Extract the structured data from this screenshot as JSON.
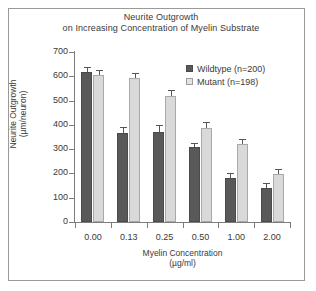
{
  "figure": {
    "frame_color": "#9a9a9a",
    "background": "#ffffff"
  },
  "chart_data": {
    "type": "bar",
    "title": "Neurite Outgrowth on Increasing Concentration of Myelin Substrate",
    "title_lines": [
      "Neurite Outgrowth",
      "on Increasing Concentration of Myelin Substrate"
    ],
    "xlabel": "Myelin Concentration (µg/ml)",
    "xlabel_lines": [
      "Myelin Concentration",
      "(µg/ml)"
    ],
    "ylabel": "Neurite Outgrowth (µm/neuron)",
    "ylabel_lines": [
      "Neurite Outgrowth",
      "(µm/neuron)"
    ],
    "categories": [
      "0.00",
      "0.13",
      "0.25",
      "0.50",
      "1.00",
      "2.00"
    ],
    "ylim": [
      0,
      700
    ],
    "yticks": [
      0,
      100,
      200,
      300,
      400,
      500,
      600,
      700
    ],
    "ytick_labels": [
      "0",
      "100",
      "200",
      "300",
      "400",
      "500",
      "600",
      "700"
    ],
    "grid": false,
    "legend_position": "upper right",
    "series": [
      {
        "name": "Wildtype (n=200)",
        "color": "#595959",
        "values": [
          617,
          368,
          372,
          307,
          182,
          140
        ],
        "errors": [
          18,
          20,
          22,
          16,
          16,
          17
        ]
      },
      {
        "name": "Mutant (n=198)",
        "color": "#d9d9d9",
        "values": [
          604,
          594,
          519,
          389,
          321,
          198
        ],
        "errors": [
          16,
          17,
          19,
          17,
          15,
          16
        ]
      }
    ]
  },
  "legend": {
    "items": [
      {
        "label": "Wildtype (n=200)",
        "key": "wildtype"
      },
      {
        "label": "Mutant (n=198)",
        "key": "mutant"
      }
    ]
  }
}
